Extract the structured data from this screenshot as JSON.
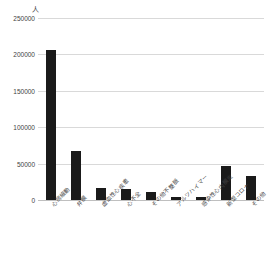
{
  "chart_data": {
    "type": "bar",
    "title": "",
    "subtitle": "",
    "xlabel": "",
    "ylabel": "",
    "unit_label": "人",
    "categories": [
      "心房細動",
      "弁膜",
      "虚血性心疾患",
      "心不全",
      "その他不整脈",
      "アルツハイマー",
      "感染性心内膜炎",
      "新型コロナ",
      "その他"
    ],
    "values": [
      206000,
      68000,
      17000,
      14500,
      10500,
      4500,
      3800,
      46500,
      33000
    ],
    "ylim": [
      0,
      250000
    ],
    "yticks": [
      0,
      50000,
      100000,
      150000,
      200000,
      250000
    ],
    "ytick_labels": [
      "0",
      "50000",
      "100000",
      "150000",
      "200000",
      "250000"
    ],
    "grid": true,
    "legend": false,
    "legend_position": "none",
    "bar_color": "#1a1a1a",
    "gridline_color": "#d9d9d9",
    "axis_color": "#bfbfbf",
    "background_color": "#ffffff"
  }
}
